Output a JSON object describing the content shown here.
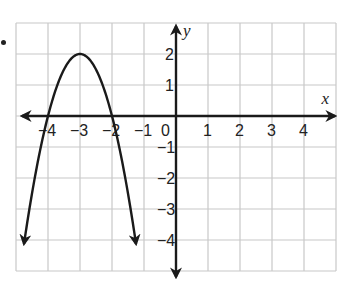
{
  "chart_data": {
    "type": "line",
    "title": "",
    "xlabel": "x",
    "ylabel": "y",
    "xlim": [
      -5,
      5
    ],
    "ylim": [
      -5,
      3
    ],
    "grid": true,
    "x_ticks": [
      -4,
      -3,
      -2,
      -1,
      0,
      1,
      2,
      3,
      4
    ],
    "x_tick_labels": [
      "−4",
      "−3",
      "−2",
      "−1",
      "0",
      "1",
      "2",
      "3",
      "4"
    ],
    "y_ticks": [
      2,
      1,
      -1,
      -2,
      -3,
      -4
    ],
    "y_tick_labels": [
      "2",
      "1",
      "−1",
      "−2",
      "−3",
      "−4"
    ],
    "series": [
      {
        "name": "parabola",
        "equation": "y = -2(x + 3)^2 + 2",
        "vertex": [
          -3,
          2
        ],
        "x_intercepts": [
          -4,
          -2
        ],
        "x": [
          -4.75,
          -4.5,
          -4,
          -3.5,
          -3,
          -2.5,
          -2,
          -1.5,
          -1.25
        ],
        "y": [
          -4.125,
          -2.5,
          0,
          1.5,
          2,
          1.5,
          0,
          -2.5,
          -4.125
        ],
        "arrows_at_ends": true
      }
    ],
    "colors": {
      "grid": "#c8c8c8",
      "axis": "#1a1a1a",
      "curve": "#1a1a1a"
    }
  }
}
